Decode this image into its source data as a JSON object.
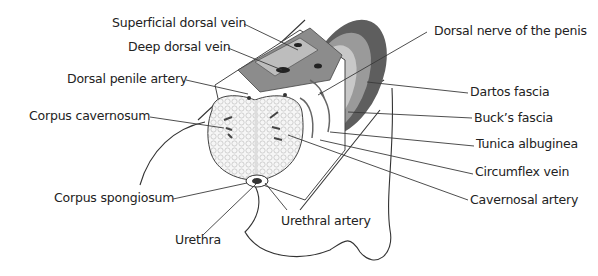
{
  "diagram": {
    "labels": [
      {
        "id": "superficial-dorsal-vein",
        "text": "Superficial dorsal vein",
        "x": 112,
        "y": 16
      },
      {
        "id": "deep-dorsal-vein",
        "text": "Deep dorsal vein",
        "x": 128,
        "y": 40
      },
      {
        "id": "dorsal-penile-artery",
        "text": "Dorsal penile artery",
        "x": 67,
        "y": 72
      },
      {
        "id": "corpus-cavernosum",
        "text": "Corpus cavernosum",
        "x": 29,
        "y": 109
      },
      {
        "id": "corpus-spongiosum",
        "text": "Corpus spongiosum",
        "x": 54,
        "y": 191
      },
      {
        "id": "urethra",
        "text": "Urethra",
        "x": 175,
        "y": 233
      },
      {
        "id": "urethral-artery",
        "text": "Urethral artery",
        "x": 281,
        "y": 214
      },
      {
        "id": "dorsal-nerve",
        "text": "Dorsal nerve of the penis",
        "x": 434,
        "y": 24
      },
      {
        "id": "dartos-fascia",
        "text": "Dartos fascia",
        "x": 470,
        "y": 85
      },
      {
        "id": "bucks-fascia",
        "text": "Buck’s fascia",
        "x": 474,
        "y": 111
      },
      {
        "id": "tunica-albuginea",
        "text": "Tunica albuginea",
        "x": 476,
        "y": 137
      },
      {
        "id": "circumflex-vein",
        "text": "Circumflex vein",
        "x": 475,
        "y": 165
      },
      {
        "id": "cavernosal-artery",
        "text": "Cavernosal artery",
        "x": 470,
        "y": 193
      }
    ],
    "colors": {
      "line": "#3a3a3a",
      "text": "#222222",
      "dartos": "#6b6b6b",
      "bucks": "#9a9a9a",
      "tunica": "#c4c4c4",
      "vessel": "#8a8a8a",
      "sponge": "#f2f2f2"
    }
  }
}
